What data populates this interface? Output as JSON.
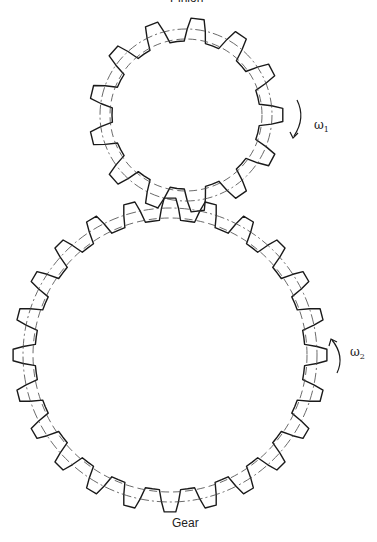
{
  "labels": {
    "top": "Pinion",
    "bottom": "Gear",
    "omega1_base": "ω",
    "omega1_sub": "1",
    "omega2_base": "ω",
    "omega2_sub": "2"
  },
  "pinion": {
    "cx": 186,
    "cy": 115,
    "teeth": 13,
    "tip_r": 97,
    "root_r": 74,
    "pitch_r": 86,
    "base_r": 76,
    "phase": 0.12
  },
  "gear": {
    "cx": 170,
    "cy": 355,
    "teeth": 24,
    "tip_r": 157,
    "root_r": 135,
    "pitch_r": 147,
    "base_r": 137,
    "phase": 0
  },
  "colors": {
    "line": "#1a1a1a",
    "circle": "#444444"
  }
}
